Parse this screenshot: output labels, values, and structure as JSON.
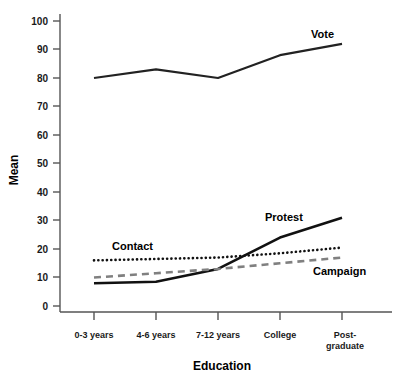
{
  "chart_data": {
    "type": "line",
    "title": "",
    "xlabel": "Education",
    "ylabel": "Mean",
    "categories": [
      "0-3 years",
      "4-6 years",
      "7-12 years",
      "College",
      "Post-graduate"
    ],
    "category_label_lines": [
      [
        "0-3 years"
      ],
      [
        "4-6 years"
      ],
      [
        "7-12 years"
      ],
      [
        "College"
      ],
      [
        "Post-",
        "graduate"
      ]
    ],
    "ylim": [
      0,
      100
    ],
    "yticks": [
      0,
      10,
      20,
      30,
      40,
      50,
      60,
      70,
      80,
      90,
      100
    ],
    "grid": "none",
    "legend": "inline-annotations",
    "series": [
      {
        "name": "Vote",
        "values": [
          80,
          83,
          80,
          88,
          92
        ],
        "style": "solid",
        "color": "#222222",
        "width": 2.2,
        "label_x": 311,
        "label_y": 38
      },
      {
        "name": "Protest",
        "values": [
          8,
          8.5,
          13,
          24,
          31
        ],
        "style": "solid",
        "color": "#111111",
        "width": 2.6,
        "label_x": 265,
        "label_y": 221
      },
      {
        "name": "Contact",
        "values": [
          16,
          16.5,
          17,
          18.5,
          20.5
        ],
        "style": "dotted",
        "color": "#111111",
        "width": 2.6,
        "label_x": 112,
        "label_y": 250
      },
      {
        "name": "Campaign",
        "values": [
          10,
          11.5,
          13,
          15,
          17
        ],
        "style": "dashed",
        "color": "#808080",
        "width": 2.6,
        "label_x": 313,
        "label_y": 275
      }
    ]
  },
  "axes": {
    "y_tick_labels": [
      "100",
      "90",
      "80",
      "70",
      "60",
      "50",
      "40",
      "30",
      "20",
      "10",
      "0"
    ],
    "y_axis_title": "Mean",
    "x_axis_title": "Education"
  },
  "colors": {
    "axis": "#555555",
    "text": "#111111",
    "vote_line": "#222222",
    "protest_line": "#111111",
    "contact_line": "#111111",
    "campaign_line": "#808080",
    "background": "#ffffff"
  }
}
